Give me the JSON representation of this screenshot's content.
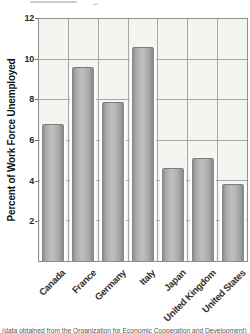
{
  "figure": {
    "caption": "(data obtained from the Organization for Economic Cooperation and Development)"
  },
  "chart_data": {
    "type": "bar",
    "title": "",
    "categories": [
      "Canada",
      "France",
      "Germany",
      "Italy",
      "Japan",
      "United Kingdom",
      "United States"
    ],
    "values": [
      6.8,
      9.6,
      7.9,
      10.6,
      4.6,
      5.1,
      3.8
    ],
    "xlabel": "",
    "ylabel": "Percent of Work Force Unemployed",
    "ylim": [
      0,
      12
    ],
    "yticks": [
      2,
      4,
      6,
      8,
      10,
      12
    ],
    "grid": true,
    "legend": false,
    "colors": {
      "bar_edge": "#848484",
      "bar_highlight": "#bdbdbd",
      "bar_mid": "#a9a9a9",
      "plot_bg": "#f4f4f0",
      "grid_line": "#a8a8a8",
      "bar_well": "#ffffff",
      "axis_text": "#2a2a2a"
    }
  }
}
